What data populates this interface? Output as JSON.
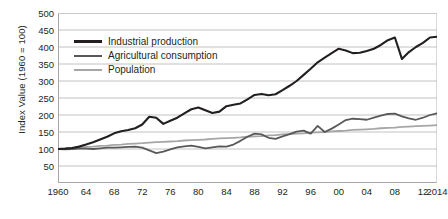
{
  "chart_data": {
    "type": "line",
    "title": "",
    "xlabel": "",
    "ylabel": "Index Value (1960 = 100)",
    "ylim": [
      0,
      500
    ],
    "xlim": [
      1960,
      2014
    ],
    "grid": true,
    "legend_position": "top-left",
    "y_ticks": [
      500,
      450,
      400,
      350,
      300,
      250,
      200,
      150,
      100,
      50
    ],
    "x_tick_labels": [
      "1960",
      "64",
      "68",
      "72",
      "76",
      "80",
      "84",
      "88",
      "92",
      "96",
      "00",
      "04",
      "08",
      "12",
      "2014"
    ],
    "x_tick_years": [
      1960,
      1964,
      1968,
      1972,
      1976,
      1980,
      1984,
      1988,
      1992,
      1996,
      2000,
      2004,
      2008,
      2012,
      2014
    ],
    "x": [
      1960,
      1961,
      1962,
      1963,
      1964,
      1965,
      1966,
      1967,
      1968,
      1969,
      1970,
      1971,
      1972,
      1973,
      1974,
      1975,
      1976,
      1977,
      1978,
      1979,
      1980,
      1981,
      1982,
      1983,
      1984,
      1985,
      1986,
      1987,
      1988,
      1989,
      1990,
      1991,
      1992,
      1993,
      1994,
      1995,
      1996,
      1997,
      1998,
      1999,
      2000,
      2001,
      2002,
      2003,
      2004,
      2005,
      2006,
      2007,
      2008,
      2009,
      2010,
      2011,
      2012,
      2013,
      2014
    ],
    "series": [
      {
        "name": "Industrial production",
        "color": "#231f20",
        "width": 2.1,
        "values": [
          100,
          101,
          103,
          107,
          113,
          120,
          128,
          136,
          146,
          152,
          156,
          161,
          172,
          195,
          192,
          174,
          183,
          192,
          205,
          217,
          222,
          214,
          206,
          210,
          226,
          230,
          234,
          246,
          259,
          262,
          258,
          261,
          273,
          286,
          300,
          318,
          336,
          355,
          369,
          382,
          395,
          390,
          382,
          383,
          388,
          395,
          406,
          420,
          428,
          365,
          385,
          400,
          412,
          428,
          430
        ]
      },
      {
        "name": "Agricultural consumption",
        "color": "#595959",
        "width": 1.8,
        "values": [
          100,
          99,
          100,
          101,
          101,
          100,
          102,
          104,
          104,
          105,
          106,
          107,
          104,
          96,
          88,
          92,
          99,
          105,
          108,
          110,
          106,
          102,
          105,
          108,
          107,
          113,
          124,
          136,
          145,
          143,
          133,
          130,
          137,
          144,
          151,
          154,
          145,
          168,
          150,
          160,
          172,
          185,
          189,
          188,
          186,
          192,
          198,
          203,
          204,
          196,
          190,
          186,
          192,
          200,
          205
        ]
      },
      {
        "name": "Population",
        "color": "#a6a6a6",
        "width": 1.8,
        "values": [
          100,
          101,
          103,
          104,
          106,
          107,
          109,
          110,
          112,
          113,
          115,
          116,
          117,
          119,
          120,
          121,
          122,
          123,
          125,
          126,
          127,
          128,
          130,
          131,
          132,
          133,
          134,
          136,
          137,
          138,
          140,
          141,
          143,
          144,
          145,
          146,
          148,
          149,
          150,
          152,
          153,
          154,
          156,
          157,
          158,
          159,
          161,
          162,
          163,
          165,
          166,
          167,
          168,
          169,
          170
        ]
      }
    ]
  },
  "legend": {
    "items": [
      {
        "label": "Industrial production",
        "color": "#231f20",
        "thickness": 3
      },
      {
        "label": "Agricultural consumption",
        "color": "#595959",
        "thickness": 2.5
      },
      {
        "label": "Population",
        "color": "#a6a6a6",
        "thickness": 2
      }
    ]
  }
}
